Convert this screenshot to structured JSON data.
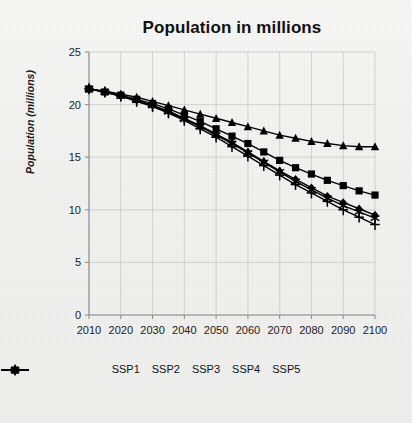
{
  "chart_data": {
    "type": "line",
    "title": "Population in millions",
    "xlabel": "",
    "ylabel": "Population (millions)",
    "xlim": [
      2010,
      2100
    ],
    "ylim": [
      0,
      25
    ],
    "yticks": [
      0,
      5,
      10,
      15,
      20,
      25
    ],
    "xticks": [
      2010,
      2020,
      2030,
      2040,
      2050,
      2060,
      2070,
      2080,
      2090,
      2100
    ],
    "grid": true,
    "legend_position": "bottom",
    "x": [
      2010,
      2015,
      2020,
      2025,
      2030,
      2035,
      2040,
      2045,
      2050,
      2055,
      2060,
      2065,
      2070,
      2075,
      2080,
      2085,
      2090,
      2095,
      2100
    ],
    "series": [
      {
        "name": "SSP1",
        "marker": "diamond",
        "values": [
          21.5,
          21.2,
          20.8,
          20.4,
          19.9,
          19.4,
          18.7,
          18.0,
          17.2,
          16.4,
          15.5,
          14.6,
          13.7,
          12.9,
          12.1,
          11.3,
          10.7,
          10.1,
          9.5
        ]
      },
      {
        "name": "SSP2",
        "marker": "square",
        "values": [
          21.5,
          21.2,
          20.9,
          20.5,
          20.1,
          19.6,
          19.0,
          18.4,
          17.7,
          17.0,
          16.3,
          15.5,
          14.7,
          14.0,
          13.4,
          12.8,
          12.3,
          11.8,
          11.4
        ]
      },
      {
        "name": "SSP3",
        "marker": "triangle",
        "values": [
          21.5,
          21.3,
          21.0,
          20.7,
          20.3,
          19.9,
          19.5,
          19.1,
          18.7,
          18.3,
          17.9,
          17.5,
          17.1,
          16.8,
          16.5,
          16.3,
          16.1,
          16.0,
          16.0
        ]
      },
      {
        "name": "SSP4",
        "marker": "plus",
        "values": [
          21.5,
          21.2,
          20.8,
          20.3,
          19.8,
          19.2,
          18.5,
          17.7,
          16.9,
          16.0,
          15.1,
          14.2,
          13.3,
          12.4,
          11.6,
          10.8,
          10.0,
          9.3,
          8.6
        ]
      },
      {
        "name": "SSP5",
        "marker": "asterisk",
        "values": [
          21.5,
          21.2,
          20.8,
          20.4,
          19.9,
          19.3,
          18.6,
          17.9,
          17.1,
          16.3,
          15.4,
          14.5,
          13.6,
          12.7,
          11.9,
          11.1,
          10.4,
          9.8,
          9.2
        ]
      }
    ]
  },
  "legend": {
    "items": [
      {
        "label": "SSP1",
        "marker": "diamond"
      },
      {
        "label": "SSP2",
        "marker": "square"
      },
      {
        "label": "SSP3",
        "marker": "triangle"
      },
      {
        "label": "SSP4",
        "marker": "plus"
      },
      {
        "label": "SSP5",
        "marker": "asterisk"
      }
    ]
  },
  "colors": {
    "series": "#000000",
    "grid": "#c8c8c8",
    "axis": "#8f8f8f",
    "text": "#111111",
    "background": "#f2f2f0"
  }
}
